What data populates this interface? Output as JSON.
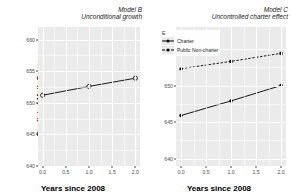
{
  "figure": {
    "axis_x_label": "Years since 2008",
    "axis_y_label": "Predicted Math Score"
  },
  "chart_data": [
    {
      "type": "line",
      "panel_id": "B",
      "title": "Model B",
      "subtitle": "Unconditional growth",
      "xlabel": "Years since 2008",
      "ylabel": "Predicted Math Score",
      "x": [
        0,
        1,
        2
      ],
      "xlim": [
        -0.1,
        2.1
      ],
      "xticks": [
        0.0,
        0.5,
        1.0,
        1.5,
        2.0
      ],
      "xticklabels": [
        "0.0",
        "0.5",
        "1.0",
        "1.5",
        "2.0"
      ],
      "ylim": [
        640,
        662
      ],
      "yticks": [
        640,
        645,
        650,
        655,
        660
      ],
      "yticklabels": [
        "640",
        "645",
        "650",
        "655",
        "660"
      ],
      "grid": true,
      "legend": null,
      "series": [
        {
          "name": "Overall",
          "values": [
            651.2,
            652.6,
            653.9
          ],
          "linestyle": "solid",
          "marker": "open-circle",
          "color": "#000000"
        }
      ]
    },
    {
      "type": "line",
      "panel_id": "C",
      "title": "Model C",
      "subtitle": "Uncontrolled charter effect",
      "xlabel": "Years since 2008",
      "ylabel": "Predicted Math Score",
      "x": [
        0,
        1,
        2
      ],
      "xlim": [
        -0.1,
        2.1
      ],
      "xticks": [
        0.0,
        0.5,
        1.0,
        1.5,
        2.0
      ],
      "xticklabels": [
        "0.0",
        "0.5",
        "1.0",
        "1.5",
        "2.0"
      ],
      "ylim": [
        639,
        658
      ],
      "yticks": [
        640,
        645,
        650,
        655
      ],
      "yticklabels": [
        "640",
        "645",
        "650",
        "655"
      ],
      "grid": true,
      "legend": {
        "title": "E",
        "position": "top-left-inside",
        "entries": [
          "Charter",
          "Public Non-charter"
        ]
      },
      "series": [
        {
          "name": "Public Non-charter",
          "values": [
            652.3,
            653.3,
            654.4
          ],
          "linestyle": "dashed",
          "marker": "filled-square",
          "color": "#000000"
        },
        {
          "name": "Charter",
          "values": [
            645.9,
            647.9,
            650.0
          ],
          "linestyle": "solid",
          "marker": "filled-circle",
          "color": "#000000"
        }
      ]
    }
  ]
}
